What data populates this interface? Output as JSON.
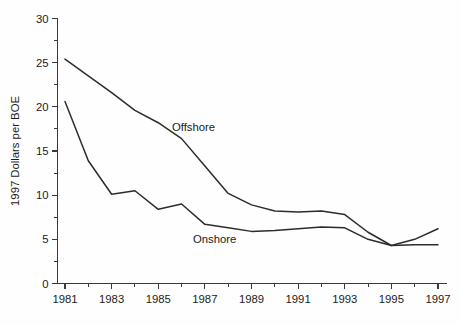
{
  "chart_data": {
    "type": "line",
    "title": "",
    "subtitle": "",
    "xlabel": "",
    "ylabel": "1997 Dollars per BOE",
    "xlim": [
      1981,
      1997
    ],
    "ylim": [
      0,
      30
    ],
    "grid": false,
    "legend_position": "inline-annotation",
    "x": [
      1981,
      1982,
      1983,
      1984,
      1985,
      1986,
      1987,
      1988,
      1989,
      1990,
      1991,
      1992,
      1993,
      1994,
      1995,
      1996,
      1997
    ],
    "series": [
      {
        "name": "Offshore",
        "annotation_label": "Offshore",
        "values": [
          25.4,
          23.5,
          21.6,
          19.6,
          18.2,
          16.4,
          13.3,
          10.2,
          8.9,
          8.2,
          8.1,
          8.2,
          7.8,
          5.8,
          4.3,
          5.0,
          6.2
        ]
      },
      {
        "name": "Onshore",
        "annotation_label": "Onshore",
        "values": [
          20.6,
          13.9,
          10.1,
          10.5,
          8.4,
          9.0,
          6.7,
          6.3,
          5.9,
          6.0,
          6.2,
          6.4,
          6.3,
          5.0,
          4.3,
          4.4,
          4.4
        ]
      }
    ],
    "y_ticks": [
      0,
      5,
      10,
      15,
      20,
      25,
      30
    ],
    "y_tick_labels": [
      "0",
      "5",
      "10",
      "15",
      "20",
      "25",
      "30"
    ],
    "x_ticks_major": [
      1981,
      1983,
      1985,
      1987,
      1989,
      1991,
      1993,
      1995,
      1997
    ],
    "x_tick_labels": [
      "1981",
      "1983",
      "1985",
      "1987",
      "1989",
      "1991",
      "1993",
      "1995",
      "1997"
    ],
    "x_ticks_minor": [
      1982,
      1984,
      1986,
      1988,
      1990,
      1992,
      1994,
      1996
    ],
    "colors": {
      "line": "#2c2c2c",
      "axis": "#3a3a3a",
      "text": "#1b1b1b",
      "background": "#fefefe"
    }
  }
}
